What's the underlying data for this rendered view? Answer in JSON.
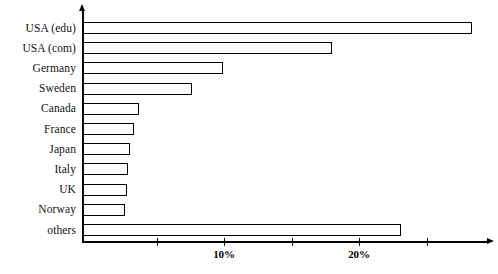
{
  "chart_data": {
    "type": "bar",
    "orientation": "horizontal",
    "title": "",
    "subtitle": "",
    "xlabel": "",
    "ylabel": "",
    "categories": [
      "USA (edu)",
      "USA (com)",
      "Germany",
      "Sweden",
      "Canada",
      "France",
      "Japan",
      "Italy",
      "UK",
      "Norway",
      "others"
    ],
    "values": [
      28.4,
      18.0,
      9.9,
      7.6,
      3.7,
      3.3,
      3.0,
      2.9,
      2.8,
      2.7,
      23.1
    ],
    "value_unit": "%",
    "xlim": [
      0,
      30.4
    ],
    "x_ticks": [
      5,
      10,
      15,
      20,
      25
    ],
    "x_tick_labels": [
      "",
      "10%",
      "",
      "20%",
      ""
    ],
    "grid": false,
    "legend": null,
    "annotations": [],
    "bar_style": {
      "fill": "#ffffff",
      "stroke": "#000000",
      "stroke_width_px": 1.4
    },
    "axis_style": {
      "color": "#000000",
      "y_axis_arrow": "up",
      "x_axis_arrow": "right"
    }
  },
  "layout": {
    "plot_left_px": 82,
    "plot_origin_px": 89,
    "px_per_percent": 13.5,
    "axis_bottom_px": 241,
    "bar_height_px": 12,
    "bar_pitch_px": 20.2,
    "first_bar_top_px": 22,
    "label_column_width_px": 76,
    "x_axis_right_px": 488
  }
}
